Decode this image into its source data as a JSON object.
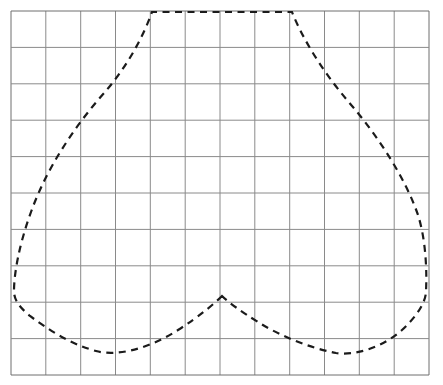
{
  "figure": {
    "background_color": "#ffffff",
    "width": 443,
    "height": 385
  },
  "grid": {
    "name": "graph-paper-grid",
    "line_color": "#8a8a8a",
    "border_color": "#6f6f6f",
    "line_width": 1,
    "columns": 12,
    "rows": 10,
    "x_min": 11,
    "x_max": 429,
    "y_min": 11,
    "y_max": 375,
    "cell_width": 34.83,
    "cell_height": 36.4,
    "x_lines": [
      11,
      45.8,
      80.7,
      115.5,
      150.3,
      185.2,
      220,
      254.8,
      289.7,
      324.5,
      359.3,
      394.2,
      429
    ],
    "y_lines": [
      11,
      47.4,
      83.8,
      120.2,
      156.6,
      193,
      229.4,
      265.8,
      302.2,
      338.6,
      375
    ]
  },
  "curve": {
    "name": "heart-curve",
    "stroke_color": "#1b1b1b",
    "stroke_width": 2.2,
    "dash_length": 7,
    "dash_gap": 5.5,
    "fill": "none",
    "closed": true,
    "key_points": {
      "notch_apex": [
        222,
        296
      ],
      "plateau_left": [
        152,
        12
      ],
      "plateau_right": [
        292,
        12
      ],
      "left_extreme": [
        14,
        292
      ],
      "right_extreme": [
        426,
        291
      ],
      "left_lobe_bottom": [
        92,
        351
      ],
      "right_lobe_bottom": [
        352,
        353
      ]
    },
    "path": "M 222 296 C 215 303 200 316 178 330 C 150 348 118 357 96 351 C 70 344 49 330 30 316 C 18 306 14 299 14 291 C 14 274 19 245 31 212 C 46 170 73 128 105 92 C 125 69 142 40 152 12 L 292 12 C 304 42 325 74 347 100 C 380 138 406 180 418 215 C 426 240 427 272 426 291 C 426 302 417 316 402 330 C 382 348 354 356 336 353 C 310 348 280 336 258 322 C 239 310 228 302 222 296 Z"
  }
}
